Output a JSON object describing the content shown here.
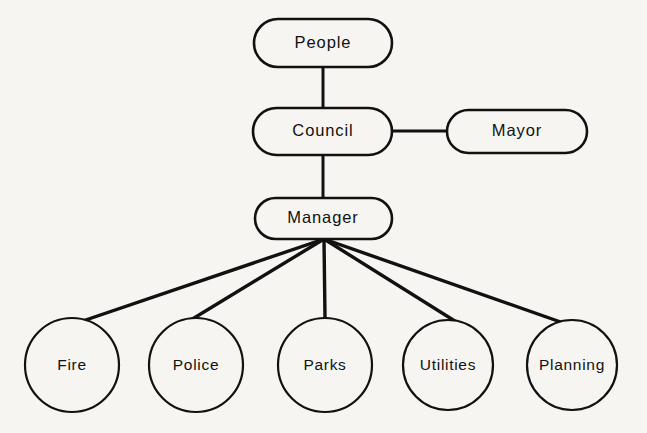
{
  "diagram": {
    "type": "organization-chart",
    "colors": {
      "background": "#f7f5f1",
      "stroke": "#111111",
      "node_fill": "#f7f5f1"
    },
    "nodes": [
      {
        "id": "people",
        "label": "People",
        "shape": "rounded-rectangle",
        "cx": 323,
        "cy": 43,
        "w": 138,
        "h": 48,
        "level": 0
      },
      {
        "id": "council",
        "label": "Council",
        "shape": "rounded-rectangle",
        "cx": 323,
        "cy": 131,
        "w": 139,
        "h": 47,
        "level": 1
      },
      {
        "id": "mayor",
        "label": "Mayor",
        "shape": "rounded-rectangle",
        "cx": 517,
        "cy": 131,
        "w": 140,
        "h": 43,
        "level": 1
      },
      {
        "id": "manager",
        "label": "Manager",
        "shape": "rounded-rectangle",
        "cx": 323,
        "cy": 218,
        "w": 137,
        "h": 41,
        "level": 2
      },
      {
        "id": "fire",
        "label": "Fire",
        "shape": "circle",
        "cx": 72,
        "cy": 365,
        "r": 47,
        "level": 3
      },
      {
        "id": "police",
        "label": "Police",
        "shape": "circle",
        "cx": 196,
        "cy": 365,
        "r": 47,
        "level": 3
      },
      {
        "id": "parks",
        "label": "Parks",
        "shape": "circle",
        "cx": 325,
        "cy": 365,
        "r": 47,
        "level": 3
      },
      {
        "id": "utilities",
        "label": "Utilities",
        "shape": "circle",
        "cx": 448,
        "cy": 365,
        "r": 45,
        "level": 3
      },
      {
        "id": "planning",
        "label": "Planning",
        "shape": "circle",
        "cx": 572,
        "cy": 365,
        "r": 45,
        "level": 3
      }
    ],
    "edges": [
      {
        "from": "people",
        "to": "council",
        "kind": "vertical"
      },
      {
        "from": "council",
        "to": "mayor",
        "kind": "horizontal"
      },
      {
        "from": "council",
        "to": "manager",
        "kind": "vertical"
      },
      {
        "from": "manager",
        "to": "fire",
        "kind": "fan"
      },
      {
        "from": "manager",
        "to": "police",
        "kind": "fan"
      },
      {
        "from": "manager",
        "to": "parks",
        "kind": "fan"
      },
      {
        "from": "manager",
        "to": "utilities",
        "kind": "fan"
      },
      {
        "from": "manager",
        "to": "planning",
        "kind": "fan"
      }
    ]
  }
}
